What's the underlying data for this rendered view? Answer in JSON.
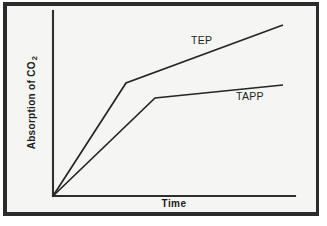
{
  "figure": {
    "background_color": "#ffffff",
    "plot_background_color": "#f5f5f3",
    "frame_color": "#2b2b2b",
    "line_color": "#262626",
    "axis_color": "#2f2f2f"
  },
  "chart_data": {
    "type": "line",
    "title": "",
    "subtitle": "",
    "xlabel": "Time",
    "ylabel": "Absorption of CO",
    "ylabel_subscript": "2",
    "xlim": [
      0,
      100
    ],
    "ylim": [
      0,
      100
    ],
    "grid": false,
    "xticks": [],
    "yticks": [],
    "xticklabels": [],
    "yticklabels": [],
    "legend_position": "inline-annotations",
    "series": [
      {
        "name": "TEP",
        "label": "TEP",
        "x": [
          0,
          30,
          95
        ],
        "y": [
          0,
          61,
          92
        ],
        "points_px": [
          [
            53,
            196
          ],
          [
            126,
            83
          ],
          [
            283,
            25
          ]
        ],
        "label_position_px": [
          191,
          34
        ]
      },
      {
        "name": "TAPP",
        "label": "TAPP",
        "x": [
          0,
          42,
          95
        ],
        "y": [
          0,
          53,
          60
        ],
        "points_px": [
          [
            53,
            196
          ],
          [
            155,
            98
          ],
          [
            283,
            85
          ]
        ],
        "label_position_px": [
          236,
          90
        ]
      }
    ],
    "annotations": [
      {
        "text": "TEP",
        "x_px": 191,
        "y_px": 34
      },
      {
        "text": "TAPP",
        "x_px": 236,
        "y_px": 90
      }
    ],
    "axes_px": {
      "origin": [
        53,
        196
      ],
      "y_axis_top": [
        53,
        11
      ],
      "x_axis_right": [
        295,
        196
      ]
    }
  }
}
